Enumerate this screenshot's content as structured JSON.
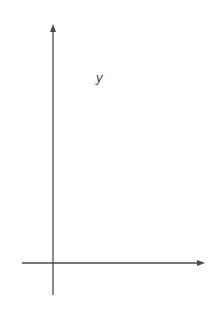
{
  "chart_data": {
    "type": "line",
    "title": "",
    "xlabel": "x",
    "ylabel": "y",
    "xlim": [
      -10,
      45
    ],
    "ylim": [
      -80,
      560
    ],
    "grid": true,
    "x_grid_step": 5,
    "y_grid_step": 40,
    "x_ticks": [
      -10,
      10,
      20,
      30,
      40
    ],
    "x_tick_labels": [
      "−10",
      "10",
      "20",
      "30",
      "40"
    ],
    "y_ticks": [
      80,
      160,
      240,
      320,
      400,
      480
    ],
    "y_tick_labels": [
      "80",
      "160",
      "240",
      "320",
      "400",
      "480"
    ],
    "annotation": {
      "text_main": "y = 20e",
      "text_exp": "0.08x"
    },
    "series": [
      {
        "name": "y = 20e^(0.08x)",
        "function": "20*exp(0.08*x)",
        "x": [
          -10,
          -5,
          0,
          5,
          10,
          15,
          20,
          25,
          30,
          35,
          40,
          41.6
        ],
        "values": [
          9.0,
          13.4,
          20,
          29.8,
          44.5,
          66.4,
          99.1,
          147.8,
          220.5,
          328.9,
          490.6,
          557
        ],
        "arrow_both_ends": true,
        "color": "#4a4a4a"
      }
    ]
  }
}
